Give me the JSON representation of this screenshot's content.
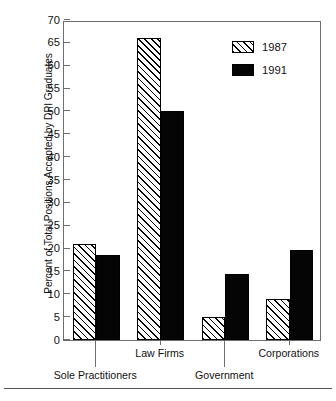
{
  "chart_data": {
    "type": "bar",
    "title": "",
    "subtitle": "",
    "xlabel": "",
    "ylabel": "Percent of Total Positions Accepted by DPI Graduates",
    "categories": [
      "Sole Practitioners",
      "Law Firms",
      "Government",
      "Corporations"
    ],
    "series": [
      {
        "name": "1987",
        "values": [
          21,
          66,
          5,
          9
        ],
        "pattern": "diagonal-hatch",
        "color": "#ffffff"
      },
      {
        "name": "1991",
        "values": [
          18.7,
          50,
          14.5,
          19.8
        ],
        "pattern": "solid",
        "color": "#000000"
      }
    ],
    "ylim": [
      0,
      70
    ],
    "ytick_step": 5,
    "yticks": [
      0,
      5,
      10,
      15,
      20,
      25,
      30,
      35,
      40,
      45,
      50,
      55,
      60,
      65,
      70
    ],
    "ytick_labels": [
      "0",
      "5",
      "10",
      "15",
      "20",
      "25",
      "30",
      "35",
      "40",
      "45",
      "50",
      "55",
      "60",
      "65",
      "70"
    ],
    "grid": false,
    "legend_position": "top-right",
    "legend_entries": [
      "1987",
      "1991"
    ],
    "xlabel_layout": "staggered-two-row",
    "xlabel_rows": [
      {
        "row": "upper",
        "labels": [
          "Law Firms",
          "Corporations"
        ]
      },
      {
        "row": "lower",
        "labels": [
          "Sole Practitioners",
          "Government"
        ]
      }
    ],
    "axis_color": "#6e6e6e",
    "bar_outline_color": "#000000"
  }
}
